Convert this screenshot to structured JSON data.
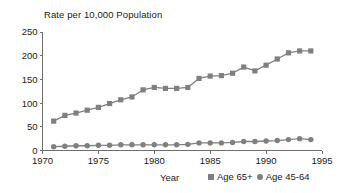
{
  "chart_data": {
    "type": "line",
    "title": "Rate per 10,000 Population",
    "xlabel": "Year",
    "ylabel": "",
    "xlim": [
      1970,
      1995
    ],
    "ylim": [
      0,
      250
    ],
    "grid": false,
    "legend_position": "bottom-right",
    "xticks": [
      "1970",
      "1975",
      "1980",
      "1985",
      "1990",
      "1995"
    ],
    "yticks": [
      "0",
      "50",
      "100",
      "150",
      "200",
      "250"
    ],
    "x": [
      1971,
      1972,
      1973,
      1974,
      1975,
      1976,
      1977,
      1978,
      1979,
      1980,
      1981,
      1982,
      1983,
      1984,
      1985,
      1986,
      1987,
      1988,
      1989,
      1990,
      1991,
      1992,
      1993,
      1994
    ],
    "series": [
      {
        "name": "Age 65+",
        "marker": "square",
        "color": "#808080",
        "values": [
          62,
          74,
          79,
          85,
          91,
          99,
          107,
          113,
          128,
          133,
          131,
          131,
          133,
          152,
          157,
          158,
          163,
          176,
          168,
          180,
          193,
          206,
          210,
          210
        ]
      },
      {
        "name": "Age 45-64",
        "marker": "circle",
        "color": "#808080",
        "values": [
          8,
          9,
          10,
          10,
          11,
          11,
          12,
          12,
          12,
          12,
          12,
          12,
          13,
          16,
          16,
          16,
          17,
          19,
          19,
          20,
          21,
          23,
          25,
          23
        ]
      }
    ]
  },
  "legend": {
    "items": [
      {
        "label": "Age 65+",
        "marker": "square"
      },
      {
        "label": "Age 45-64",
        "marker": "circle"
      }
    ]
  },
  "colors": {
    "series": "#808080",
    "axis": "#6e6e6e",
    "text": "#1a1a1a",
    "background": "#ffffff"
  }
}
